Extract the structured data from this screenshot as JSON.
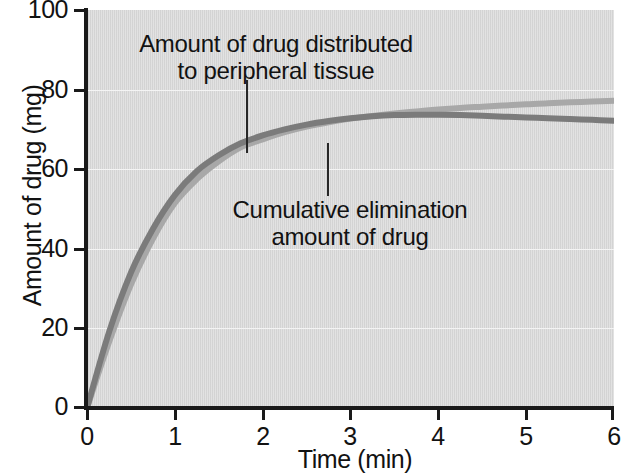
{
  "chart_data": {
    "type": "line",
    "title": "",
    "xlabel": "Time (min)",
    "ylabel": "Amount of drug (mg)",
    "xlim": [
      0,
      6
    ],
    "ylim": [
      0,
      100
    ],
    "xticks": [
      "0",
      "1",
      "2",
      "3",
      "4",
      "5",
      "6"
    ],
    "yticks": [
      "0",
      "20",
      "40",
      "60",
      "80",
      "100"
    ],
    "grid": "horizontal",
    "legend_position": "inline-annotations",
    "plot_background": "#d6d6d6",
    "series": [
      {
        "name": "Amount of drug distributed to peripheral tissue",
        "color": "#7b7b7b",
        "x": [
          0,
          0.25,
          0.5,
          0.75,
          1,
          1.25,
          1.5,
          1.75,
          2,
          2.25,
          2.5,
          2.75,
          3,
          3.25,
          3.5,
          3.75,
          4,
          4.25,
          4.5,
          4.75,
          5,
          5.25,
          5.5,
          5.75,
          6
        ],
        "values": [
          0,
          19,
          34,
          45,
          53.5,
          59.5,
          63.5,
          66.5,
          68.5,
          70,
          71.2,
          72.1,
          72.8,
          73.3,
          73.6,
          73.7,
          73.7,
          73.6,
          73.4,
          73.2,
          73,
          72.8,
          72.6,
          72.4,
          72.2
        ]
      },
      {
        "name": "Cumulative elimination amount of drug",
        "color": "#a8a8a8",
        "x": [
          0,
          0.25,
          0.5,
          0.75,
          1,
          1.25,
          1.5,
          1.75,
          2,
          2.25,
          2.5,
          2.75,
          3,
          3.25,
          3.5,
          3.75,
          4,
          4.25,
          4.5,
          4.75,
          5,
          5.25,
          5.5,
          5.75,
          6
        ],
        "values": [
          0,
          16.5,
          31,
          42.5,
          51.5,
          57.5,
          62,
          65.5,
          67.5,
          69.3,
          70.7,
          71.8,
          72.7,
          73.4,
          74,
          74.5,
          75,
          75.4,
          75.7,
          76,
          76.3,
          76.6,
          76.8,
          77,
          77.2
        ]
      }
    ],
    "annotations": [
      {
        "name": "peripheral-tissue-label",
        "text": "Amount of drug distributed\nto peripheral tissue",
        "line1": "Amount of drug distributed",
        "line2": "to peripheral tissue",
        "points_to_series": "Amount of drug distributed to peripheral tissue"
      },
      {
        "name": "cumulative-elimination-label",
        "text": "Cumulative elimination\namount of drug",
        "line1": "Cumulative elimination",
        "line2": "amount of drug",
        "points_to_series": "Cumulative elimination amount of drug"
      }
    ]
  },
  "axes": {
    "y_title": "Amount of drug (mg)",
    "x_title": "Time (min)",
    "y_tick_labels": [
      "100",
      "80",
      "60",
      "40",
      "20",
      "0"
    ],
    "x_tick_labels": [
      "0",
      "1",
      "2",
      "3",
      "4",
      "5",
      "6"
    ]
  },
  "annotations": {
    "peripheral": "Amount of drug distributed\nto peripheral tissue",
    "elimination": "Cumulative elimination\namount of drug"
  },
  "colors": {
    "series_dark": "#7b7b7b",
    "series_light": "#a8a8a8",
    "axis": "#1a1a1a",
    "plot_background": "#d6d6d6",
    "gridline": "#f4f4f4",
    "text": "#121212"
  }
}
